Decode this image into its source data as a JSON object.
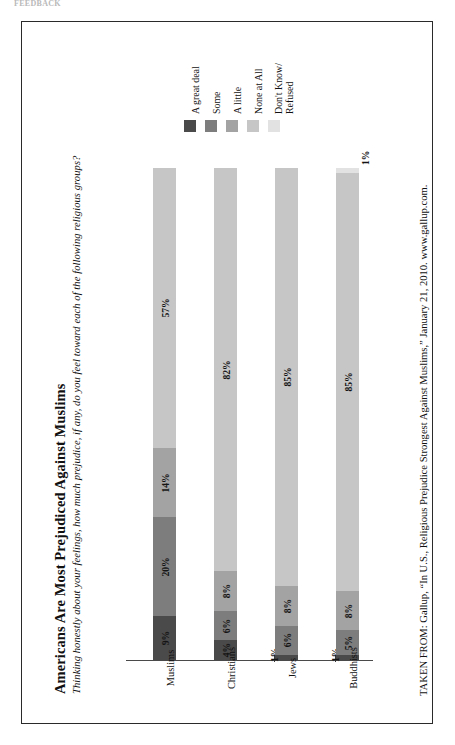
{
  "page": {
    "top_sliver_text": "FEEDBACK"
  },
  "figure": {
    "title": "Americans Are Most Prejudiced Against Muslims",
    "subtitle": "Thinking honestly about your feelings, how much prejudice, if any, do you feel toward each of the following religious groups?",
    "source": "TAKEN FROM: Gallup, “In U.S., Religious Prejudice Strongest Against Muslims,” January 21, 2010. www.gallup.com."
  },
  "legend": {
    "items": [
      {
        "label": "A great deal",
        "label_line2": "",
        "color": "#4a4a4a"
      },
      {
        "label": "Some",
        "label_line2": "",
        "color": "#7d7d7d"
      },
      {
        "label": "A little",
        "label_line2": "",
        "color": "#a3a3a3"
      },
      {
        "label": "None at All",
        "label_line2": "",
        "color": "#c6c6c6"
      },
      {
        "label": "Don't Know/",
        "label_line2": "Refused",
        "color": "#e2e2e2"
      }
    ]
  },
  "chart_data": {
    "type": "bar",
    "orientation": "stacked-vertical-rotated",
    "title": "Americans Are Most Prejudiced Against Muslims",
    "subtitle": "Thinking honestly about your feelings, how much prejudice, if any, do you feel toward each of the following religious groups?",
    "xlabel": "",
    "ylabel": "",
    "ylim": [
      0,
      100
    ],
    "grid": false,
    "legend_position": "top",
    "units": "percent",
    "categories": [
      "Muslims",
      "Christians",
      "Jews",
      "Buddhists"
    ],
    "series": [
      {
        "name": "A great deal",
        "color": "#4a4a4a",
        "values": [
          9,
          4,
          1,
          1
        ]
      },
      {
        "name": "Some",
        "color": "#7d7d7d",
        "values": [
          20,
          6,
          6,
          5
        ]
      },
      {
        "name": "A little",
        "color": "#a3a3a3",
        "values": [
          14,
          8,
          8,
          8
        ]
      },
      {
        "name": "None at All",
        "color": "#c6c6c6",
        "values": [
          57,
          82,
          85,
          85
        ]
      },
      {
        "name": "Don't Know/Refused",
        "color": "#e2e2e2",
        "values": [
          0,
          1,
          0,
          1
        ]
      }
    ],
    "bars": [
      {
        "category": "Muslims",
        "segments": [
          {
            "series": "A great deal",
            "value": 9,
            "label": "9%",
            "color": "#4a4a4a",
            "label_position": "inside"
          },
          {
            "series": "Some",
            "value": 20,
            "label": "20%",
            "color": "#7d7d7d",
            "label_position": "inside"
          },
          {
            "series": "A little",
            "value": 14,
            "label": "14%",
            "color": "#a3a3a3",
            "label_position": "inside"
          },
          {
            "series": "None at All",
            "value": 57,
            "label": "57%",
            "color": "#c6c6c6",
            "label_position": "inside"
          }
        ]
      },
      {
        "category": "Christians",
        "segments": [
          {
            "series": "A great deal",
            "value": 4,
            "label": "4%",
            "color": "#4a4a4a",
            "label_position": "inside"
          },
          {
            "series": "Some",
            "value": 6,
            "label": "6%",
            "color": "#7d7d7d",
            "label_position": "inside"
          },
          {
            "series": "A little",
            "value": 8,
            "label": "8%",
            "color": "#a3a3a3",
            "label_position": "inside"
          },
          {
            "series": "None at All",
            "value": 82,
            "label": "82%",
            "color": "#c6c6c6",
            "label_position": "inside"
          }
        ]
      },
      {
        "category": "Jews",
        "segments": [
          {
            "series": "A great deal",
            "value": 1,
            "label": "1%",
            "color": "#4a4a4a",
            "label_position": "outside"
          },
          {
            "series": "Some",
            "value": 6,
            "label": "6%",
            "color": "#7d7d7d",
            "label_position": "inside"
          },
          {
            "series": "A little",
            "value": 8,
            "label": "8%",
            "color": "#a3a3a3",
            "label_position": "inside"
          },
          {
            "series": "None at All",
            "value": 85,
            "label": "85%",
            "color": "#c6c6c6",
            "label_position": "inside"
          }
        ]
      },
      {
        "category": "Buddhists",
        "segments": [
          {
            "series": "A great deal",
            "value": 1,
            "label": "1%",
            "color": "#4a4a4a",
            "label_position": "outside"
          },
          {
            "series": "Some",
            "value": 5,
            "label": "5%",
            "color": "#7d7d7d",
            "label_position": "inside"
          },
          {
            "series": "A little",
            "value": 8,
            "label": "8%",
            "color": "#a3a3a3",
            "label_position": "inside"
          },
          {
            "series": "None at All",
            "value": 85,
            "label": "85%",
            "color": "#c6c6c6",
            "label_position": "inside"
          },
          {
            "series": "Don't Know/Refused",
            "value": 1,
            "label": "1%",
            "color": "#e2e2e2",
            "label_position": "outside-top"
          }
        ]
      }
    ],
    "annotations": [
      {
        "text": "1%",
        "near": "Jews"
      },
      {
        "text": "1%",
        "near": "Buddhists"
      },
      {
        "text": "1%",
        "near": "Buddhists-top"
      }
    ]
  }
}
